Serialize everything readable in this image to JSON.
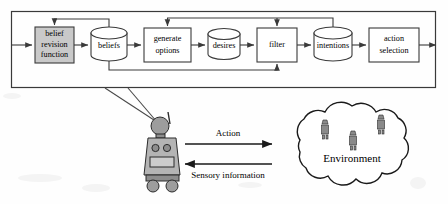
{
  "diagram": {
    "outer_frame_label": "agent-boundary",
    "pipeline": [
      {
        "id": "belief-revision-function",
        "label_lines": [
          "belief",
          "revision",
          "function"
        ],
        "shape": "rect",
        "shaded": true
      },
      {
        "id": "beliefs",
        "label_lines": [
          "beliefs"
        ],
        "shape": "cylinder",
        "shaded": false
      },
      {
        "id": "generate-options",
        "label_lines": [
          "generate",
          "options"
        ],
        "shape": "rect",
        "shaded": false
      },
      {
        "id": "desires",
        "label_lines": [
          "desires"
        ],
        "shape": "cylinder",
        "shaded": false
      },
      {
        "id": "filter",
        "label_lines": [
          "filter"
        ],
        "shape": "rect",
        "shaded": false
      },
      {
        "id": "intentions",
        "label_lines": [
          "intentions"
        ],
        "shape": "cylinder",
        "shaded": false
      },
      {
        "id": "action-selection",
        "label_lines": [
          "action",
          "selection"
        ],
        "shape": "rect",
        "shaded": false
      }
    ],
    "feedback_edges": [
      {
        "id": "beliefs-to-belief-revision",
        "from": "beliefs",
        "to": "belief-revision-function",
        "route": "top"
      },
      {
        "id": "beliefs-to-filter",
        "from": "beliefs",
        "to": "filter",
        "route": "bottom"
      },
      {
        "id": "intentions-to-generate-options",
        "from": "intentions",
        "to": "generate-options",
        "route": "top"
      },
      {
        "id": "intentions-to-filter",
        "from": "intentions",
        "to": "filter",
        "route": "top"
      }
    ]
  },
  "lower": {
    "agent_name": "robot-agent",
    "action_label": "Action",
    "sensory_label": "Sensory information",
    "environment_label": "Environment",
    "environment_occupants": 3
  },
  "colors": {
    "stroke": "#3a3a3a",
    "shaded_fill": "#c9c9c9",
    "robot_body": "#9d9d9d",
    "page_background": "#fefefe"
  }
}
